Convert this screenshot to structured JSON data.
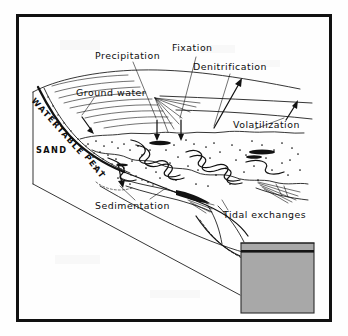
{
  "figure": {
    "type": "diagram",
    "frame": {
      "visible": true,
      "color": "#111111",
      "x": 16,
      "y": 14,
      "width": 316,
      "height": 308,
      "border_width": 3
    },
    "background_color": "#fefefe",
    "ink_color": "#121212",
    "water_fill_color": "#a8a8a8"
  },
  "labels": {
    "precipitation": "Precipitation",
    "fixation": "Fixation",
    "denitrification": "Denitrification",
    "volatilization": "Volatilization",
    "ground_water": "Ground water",
    "sedimentation": "Sedimentation",
    "tidal_exchanges": "Tidal exchanges"
  },
  "strata": {
    "watertable": "WATERTABLE",
    "sand": "SAND",
    "peat": "PEAT"
  },
  "leaders": [
    {
      "name": "precipitation-leader",
      "from": "Precipitation",
      "to": "marsh-surface"
    },
    {
      "name": "fixation-leader",
      "from": "Fixation",
      "to": "marsh-surface"
    },
    {
      "name": "denitrification-leader",
      "from": "Denitrification",
      "to": "atmosphere-arrow"
    },
    {
      "name": "volatilization-leader",
      "from": "Volatilization",
      "to": "creek-pool"
    },
    {
      "name": "ground-water-leader",
      "from": "Ground water",
      "to": "watertable-zone"
    },
    {
      "name": "sedimentation-leader",
      "from": "Sedimentation",
      "to": "peat-accretion-zone"
    },
    {
      "name": "tidal-exchanges-leader",
      "from": "Tidal exchanges",
      "to": "marsh-edge"
    }
  ]
}
